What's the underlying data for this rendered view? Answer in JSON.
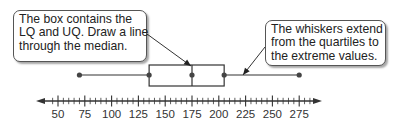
{
  "callouts": {
    "left": {
      "lines": [
        "The box contains the",
        "LQ and UQ. Draw a line",
        "through the median."
      ]
    },
    "right": {
      "lines": [
        "The whiskers extend",
        "from the quartiles to",
        "the extreme values."
      ]
    }
  },
  "axis": {
    "tick_labels": [
      "50",
      "75",
      "100",
      "125",
      "150",
      "175",
      "200",
      "225",
      "250",
      "275"
    ]
  },
  "colors": {
    "line": "#333333",
    "dot": "#444444",
    "callout_border": "#555555"
  },
  "chart_data": {
    "type": "boxplot",
    "title": "",
    "xlabel": "",
    "ylabel": "",
    "xlim": [
      40,
      290
    ],
    "major_tick_step": 25,
    "minor_tick_step": 5,
    "tick_labels": [
      50,
      75,
      100,
      125,
      150,
      175,
      200,
      225,
      250,
      275
    ],
    "min": 70,
    "q1": 135,
    "median": 175,
    "q3": 205,
    "max": 275,
    "annotations": [
      "The box contains the LQ and UQ. Draw a line through the median.",
      "The whiskers extend from the quartiles to the extreme values."
    ]
  }
}
